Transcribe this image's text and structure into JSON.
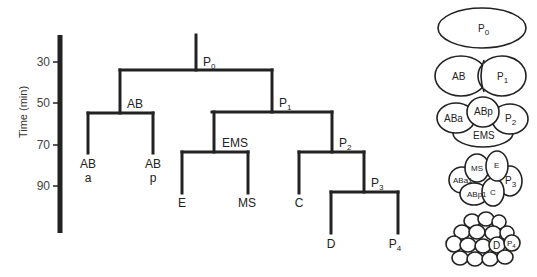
{
  "axis": {
    "title": "Time (min)",
    "ticks": [
      {
        "label": "30",
        "y": 62
      },
      {
        "label": "50",
        "y": 103
      },
      {
        "label": "70",
        "y": 145
      },
      {
        "label": "90",
        "y": 186
      }
    ]
  },
  "tree": {
    "labels": {
      "p0": "P",
      "p0_sub": "0",
      "ab": "AB",
      "p1": "P",
      "p1_sub": "1",
      "aba_line1": "AB",
      "aba_line2": "a",
      "abp_line1": "AB",
      "abp_line2": "p",
      "ems": "EMS",
      "p2": "P",
      "p2_sub": "2",
      "e": "E",
      "ms": "MS",
      "c": "C",
      "p3": "P",
      "p3_sub": "3",
      "d": "D",
      "p4": "P",
      "p4_sub": "4"
    }
  },
  "embryos": {
    "stage1": {
      "p0": "P",
      "p0_sub": "0"
    },
    "stage2": {
      "ab": "AB",
      "p1": "P",
      "p1_sub": "1"
    },
    "stage4": {
      "aba": "ABa",
      "abp": "ABp",
      "p2": "P",
      "p2_sub": "2",
      "ems": "EMS"
    },
    "stage8": {
      "aba": "ABa1",
      "abp": "ABp1",
      "ms": "MS",
      "e": "E",
      "c": "C",
      "p3": "P",
      "p3_sub": "3"
    },
    "stage28": {
      "d": "D",
      "p4": "P",
      "p4_sub": "4"
    }
  },
  "colors": {
    "line": "#222222",
    "background": "#ffffff"
  }
}
